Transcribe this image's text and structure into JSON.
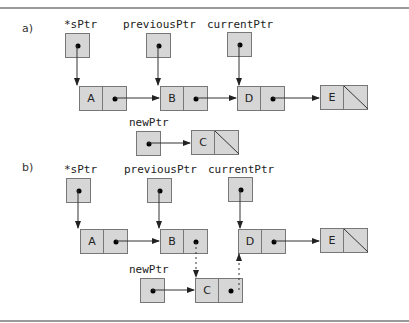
{
  "sections": {
    "a": {
      "label": "a)",
      "pointers": {
        "sPtr": "*sPtr",
        "previousPtr": "previousPtr",
        "currentPtr": "currentPtr",
        "newPtr": "newPtr"
      },
      "nodes": [
        "A",
        "B",
        "D",
        "E",
        "C"
      ]
    },
    "b": {
      "label": "b)",
      "pointers": {
        "sPtr": "*sPtr",
        "previousPtr": "previousPtr",
        "currentPtr": "currentPtr",
        "newPtr": "newPtr"
      },
      "nodes": [
        "A",
        "B",
        "D",
        "E",
        "C"
      ]
    }
  },
  "colors": {
    "fill": "#d6d6d6",
    "border": "#777777",
    "arrow": "#333333",
    "rule": "#9a9a9a"
  }
}
